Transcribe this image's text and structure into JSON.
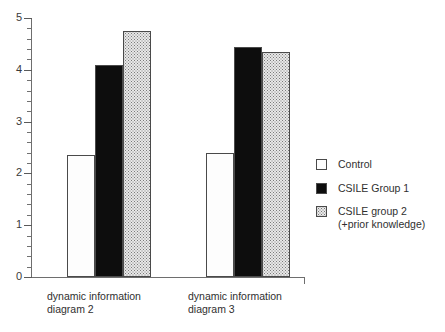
{
  "chart_data": {
    "type": "bar",
    "title": "",
    "subtitle": "",
    "xlabel": "",
    "ylabel": "",
    "ylim": [
      0,
      5
    ],
    "grid": false,
    "legend_position": "right",
    "categories": [
      "dynamic information\ndiagram 2",
      "dynamic information\ndiagram 3"
    ],
    "y_ticks": [
      "0",
      "1",
      "2",
      "3",
      "4",
      "5"
    ],
    "y_minor_tick_step": 0.2,
    "series": [
      {
        "name": "Control",
        "values": [
          2.35,
          2.4
        ],
        "pattern": "sparse-dots",
        "color": "#fdfdfd"
      },
      {
        "name": "CSILE Group 1",
        "values": [
          4.1,
          4.45
        ],
        "pattern": "solid-black",
        "color": "#0d0d0d"
      },
      {
        "name": "CSILE group 2\n(+prior knowledge)",
        "values": [
          4.75,
          4.35
        ],
        "pattern": "dense-dots",
        "color": "#e8e8e8"
      }
    ]
  },
  "axis": {
    "y_tick_0": "0",
    "y_tick_1": "1",
    "y_tick_2": "2",
    "y_tick_3": "3",
    "y_tick_4": "4",
    "y_tick_5": "5"
  },
  "categories": {
    "c0": "dynamic information\ndiagram 2",
    "c1": "dynamic information\ndiagram 3"
  },
  "legend": {
    "items": [
      {
        "label": "Control"
      },
      {
        "label": "CSILE Group 1"
      },
      {
        "label": "CSILE group 2\n(+prior knowledge)"
      }
    ]
  }
}
